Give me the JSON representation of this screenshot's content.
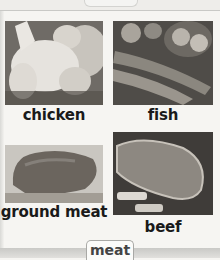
{
  "section_tab": {
    "label": "meat"
  },
  "items": [
    {
      "label": "chicken",
      "image": "chicken-photo"
    },
    {
      "label": "fish",
      "image": "fish-photo"
    },
    {
      "label": "ground meat",
      "image": "ground-meat-photo"
    },
    {
      "label": "beef",
      "image": "beef-photo"
    }
  ]
}
